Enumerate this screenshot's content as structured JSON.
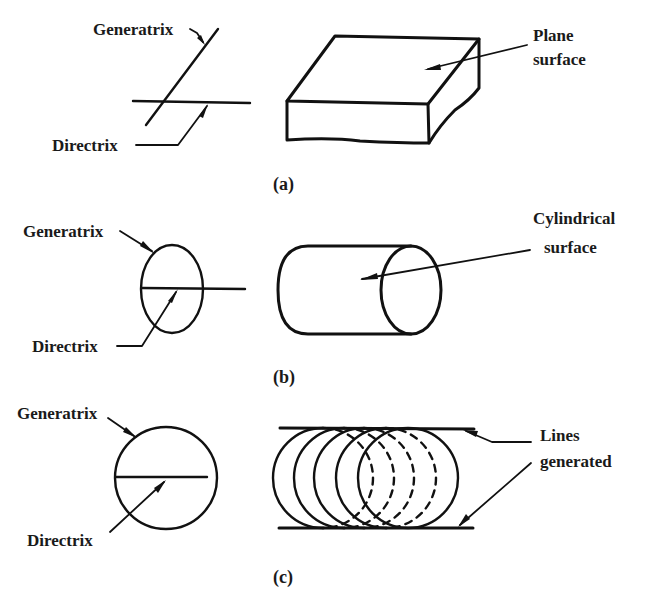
{
  "figure": {
    "panels": [
      {
        "id": "a",
        "caption": "(a)",
        "left_labels": {
          "generatrix": "Generatrix",
          "directrix": "Directrix"
        },
        "right_label": {
          "line1": "Plane",
          "line2": "surface"
        },
        "shape": "rectangular-slab"
      },
      {
        "id": "b",
        "caption": "(b)",
        "left_labels": {
          "generatrix": "Generatrix",
          "directrix": "Directrix"
        },
        "right_label": {
          "line1": "Cylindrical",
          "line2": "surface"
        },
        "shape": "cylinder"
      },
      {
        "id": "c",
        "caption": "(c)",
        "left_labels": {
          "generatrix": "Generatrix",
          "directrix": "Directrix"
        },
        "right_label": {
          "line1": "Lines",
          "line2": "generated"
        },
        "shape": "swept-circles"
      }
    ],
    "colors": {
      "ink": "#111111",
      "background": "#ffffff"
    }
  }
}
